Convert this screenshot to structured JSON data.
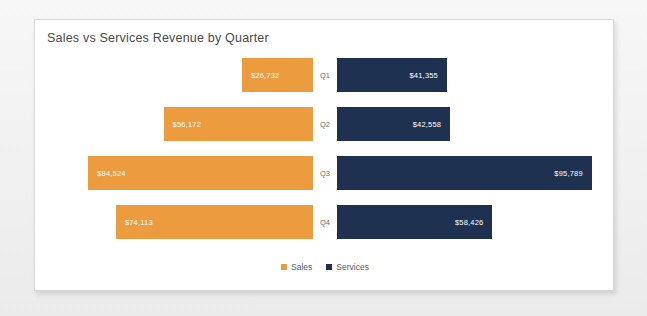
{
  "card": {
    "title": "Sales vs Services Revenue by Quarter"
  },
  "chart_data": {
    "type": "bar",
    "subtype": "diverging-horizontal-bar",
    "title": "Sales vs Services Revenue by Quarter",
    "xlabel": "",
    "ylabel": "",
    "grid": false,
    "legend_position": "bottom-center",
    "categories": [
      "Q1",
      "Q2",
      "Q3",
      "Q4"
    ],
    "series": [
      {
        "name": "Sales",
        "color": "#ED9B3F",
        "direction": "left",
        "values": [
          26732,
          56172,
          84524,
          74113
        ],
        "labels": [
          "$26,732",
          "$56,172",
          "$84,524",
          "$74,113"
        ]
      },
      {
        "name": "Services",
        "color": "#1F3151",
        "direction": "right",
        "values": [
          41355,
          42558,
          95789,
          58426
        ],
        "labels": [
          "$41,355",
          "$42,558",
          "$95,789",
          "$58,426"
        ]
      }
    ],
    "value_axis_max": 100000
  },
  "legend": {
    "items": [
      {
        "label": "Sales",
        "color": "#ED9B3F"
      },
      {
        "label": "Services",
        "color": "#1F3151"
      }
    ]
  }
}
